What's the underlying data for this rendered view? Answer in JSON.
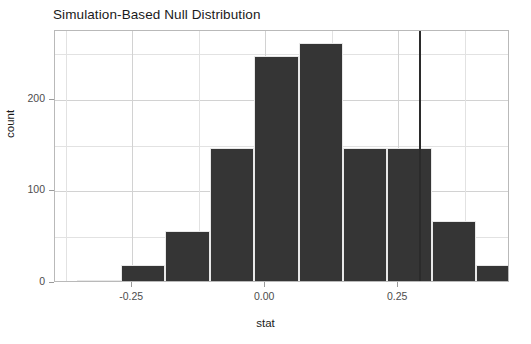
{
  "chart_data": {
    "type": "bar",
    "title": "Simulation-Based Null Distribution",
    "xlabel": "stat",
    "ylabel": "count",
    "subtitle": "",
    "categories": [
      "-0.3333",
      "-0.2500",
      "-0.1667",
      "-0.0833",
      "0.0000",
      "0.0833",
      "0.1667",
      "0.2500",
      "0.3333",
      "0.4167"
    ],
    "bin_centers": [
      -0.3125,
      -0.2292,
      -0.1458,
      -0.0625,
      0.0208,
      0.1042,
      0.1875,
      0.2708,
      0.3542,
      0.4375
    ],
    "bin_edges": [
      -0.354,
      -0.271,
      -0.188,
      -0.104,
      -0.021,
      0.063,
      0.146,
      0.229,
      0.313,
      0.396,
      0.479
    ],
    "values": [
      3,
      20,
      57,
      147,
      248,
      262,
      147,
      147,
      68,
      20
    ],
    "xlim": [
      -0.395,
      0.46
    ],
    "ylim": [
      0,
      275
    ],
    "xticks": [
      -0.25,
      0.0,
      0.25
    ],
    "xtick_labels": [
      "-0.25",
      "0.00",
      "0.25"
    ],
    "yticks": [
      0,
      100,
      200
    ],
    "ytick_labels": [
      "0",
      "100",
      "200"
    ],
    "y_minor_ticks": [
      50,
      150,
      250
    ],
    "x_minor_ticks": [
      -0.375,
      -0.125,
      0.125,
      0.375
    ],
    "grid": true,
    "legend": "none",
    "annotations": [
      {
        "name": "observed-stat-line",
        "type": "vline",
        "x": 0.2895,
        "color": "#2b2b2b",
        "label": ""
      }
    ],
    "colors": {
      "bar_fill": "#353535",
      "bar_edge": "#e8e8e8",
      "panel_background": "#ffffff",
      "grid_major": "#d2d2d2",
      "grid_minor": "#e2e2e2",
      "panel_border": "#b9b9b9",
      "text": "#1a1a1a",
      "tick_text": "#4d4d4d",
      "vline": "#2b2b2b"
    }
  }
}
